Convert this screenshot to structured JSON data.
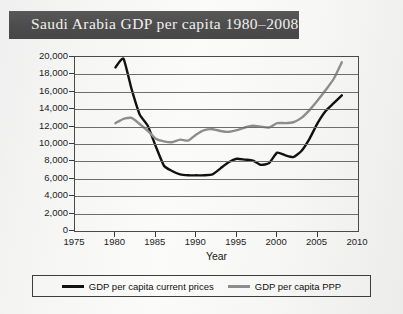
{
  "title": "Saudi Arabia GDP per capita 1980–2008",
  "colors": {
    "banner": "#4f4f4f",
    "title_text": "#f2f0ec",
    "current_prices": "#111111",
    "ppp": "#8d8d8d",
    "grid": "#6d6d6d",
    "frame": "#4a4a4a"
  },
  "axis": {
    "ylabel": "",
    "xlabel": "Year",
    "yticks": [
      "0",
      "2,000",
      "4,000",
      "6,000",
      "8,000",
      "10,000",
      "12,000",
      "14,000",
      "16,000",
      "18,000",
      "20,000"
    ],
    "xticks": [
      "1975",
      "1980",
      "1985",
      "1990",
      "1995",
      "2000",
      "2005",
      "2010"
    ]
  },
  "legend": {
    "items": [
      {
        "label": "GDP per capita current prices",
        "color": "#111111"
      },
      {
        "label": "GDP per capita PPP",
        "color": "#8d8d8d"
      }
    ]
  },
  "chart_data": {
    "type": "line",
    "title": "Saudi Arabia GDP per capita 1980–2008",
    "xlabel": "Year",
    "ylabel": "",
    "xlim": [
      1975,
      2010
    ],
    "ylim": [
      0,
      20000
    ],
    "grid": true,
    "legend_position": "bottom",
    "x": [
      1980,
      1981,
      1982,
      1983,
      1984,
      1985,
      1986,
      1987,
      1988,
      1989,
      1990,
      1991,
      1992,
      1993,
      1994,
      1995,
      1996,
      1997,
      1998,
      1999,
      2000,
      2001,
      2002,
      2003,
      2004,
      2005,
      2006,
      2007,
      2008
    ],
    "series": [
      {
        "name": "GDP per capita current prices",
        "color": "#111111",
        "values": [
          18800,
          19800,
          16300,
          13400,
          12100,
          9700,
          7500,
          6900,
          6500,
          6400,
          6400,
          6400,
          6500,
          7200,
          7900,
          8300,
          8200,
          8100,
          7600,
          7800,
          9000,
          8700,
          8500,
          9200,
          10600,
          12400,
          13800,
          14700,
          15600
        ]
      },
      {
        "name": "GDP per capita PPP",
        "color": "#8d8d8d",
        "values": [
          12400,
          12900,
          13000,
          12300,
          11500,
          10600,
          10300,
          10200,
          10500,
          10400,
          11100,
          11600,
          11700,
          11500,
          11400,
          11600,
          11900,
          12100,
          12000,
          11900,
          12400,
          12400,
          12500,
          13000,
          13900,
          15000,
          16200,
          17500,
          19400
        ]
      }
    ]
  }
}
